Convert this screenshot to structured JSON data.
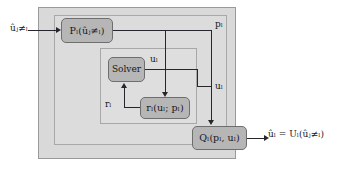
{
  "diagram": {
    "frames": {
      "outer_label": "outer-shell",
      "mid_label": "subsystem-shell",
      "inner_label": "solver-loop-shell"
    },
    "nodes": {
      "precompute": "Pₗ(ûⱼ≠ₗ)",
      "solver": "Solver",
      "residual": "rₗ(uₗ; pₗ)",
      "output": "Qₗ(pₗ, uₗ)"
    },
    "labels": {
      "input": "ûⱼ≠ₗ",
      "p_l": "pₗ",
      "u_l_mid": "uₗ",
      "u_l_right": "uₗ",
      "r_l": "rₗ",
      "output_expr": "ûₗ = Uₗ(ûⱼ≠ₗ)"
    },
    "colors": {
      "page_background": "#ffffff",
      "outer_frame_fill": "#d9d9d9",
      "mid_frame_fill": "#dcdcdc",
      "inner_frame_fill": "#dedede",
      "node_fill": "#b6b6b6",
      "node_border": "#6e6e6e",
      "line": "#26262c",
      "text": "#17171c"
    }
  }
}
